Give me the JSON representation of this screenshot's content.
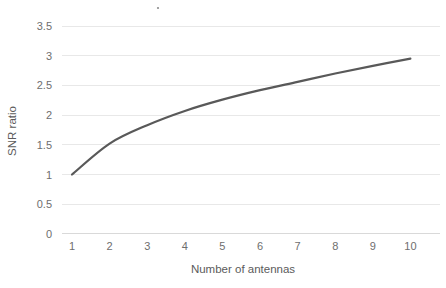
{
  "chart_data": {
    "type": "line",
    "title": "",
    "subtitle": "",
    "xlabel": "Number of antennas",
    "ylabel": "SNR ratio",
    "x": [
      1,
      2,
      3,
      4,
      5,
      6,
      7,
      8,
      9,
      10
    ],
    "categories": [
      "1",
      "2",
      "3",
      "4",
      "5",
      "6",
      "7",
      "8",
      "9",
      "10"
    ],
    "values": [
      1,
      1.52,
      1.83,
      2.07,
      2.26,
      2.42,
      2.56,
      2.7,
      2.83,
      2.95
    ],
    "series": [
      {
        "name": "SNR ratio",
        "values": [
          1,
          1.52,
          1.83,
          2.07,
          2.26,
          2.42,
          2.56,
          2.7,
          2.83,
          2.95
        ]
      }
    ],
    "xlim": [
      1,
      10
    ],
    "ylim": [
      0,
      3.5
    ],
    "xticks": [
      "1",
      "2",
      "3",
      "4",
      "5",
      "6",
      "7",
      "8",
      "9",
      "10"
    ],
    "yticks": [
      "0",
      "0.5",
      "1",
      "1.5",
      "2",
      "2.5",
      "3",
      "3.5"
    ],
    "ytick_values": [
      0,
      0.5,
      1,
      1.5,
      2,
      2.5,
      3,
      3.5
    ],
    "grid": "horizontal",
    "legend": "none",
    "line_color": "#595959",
    "grid_color": "#e8e8e8",
    "tick_label_color": "#6e6e6e",
    "axis_title_color": "#5b5b5b",
    "background_color": "#ffffff",
    "annotations": []
  },
  "axes": {
    "y_title": "SNR ratio",
    "x_title": "Number of antennas"
  },
  "y_tick_labels": [
    {
      "label": "3.5"
    },
    {
      "label": "3"
    },
    {
      "label": "2.5"
    },
    {
      "label": "2"
    },
    {
      "label": "1.5"
    },
    {
      "label": "1"
    },
    {
      "label": "0.5"
    },
    {
      "label": "0"
    }
  ],
  "x_tick_labels": [
    {
      "label": "1"
    },
    {
      "label": "2"
    },
    {
      "label": "3"
    },
    {
      "label": "4"
    },
    {
      "label": "5"
    },
    {
      "label": "6"
    },
    {
      "label": "7"
    },
    {
      "label": "8"
    },
    {
      "label": "9"
    },
    {
      "label": "10"
    }
  ]
}
